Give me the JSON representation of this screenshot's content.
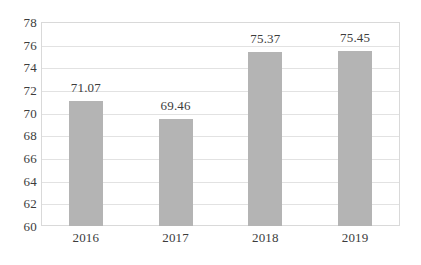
{
  "chart_data": {
    "type": "bar",
    "title": "",
    "subtitle": "",
    "xlabel": "",
    "ylabel": "",
    "categories": [
      "2016",
      "2017",
      "2018",
      "2019"
    ],
    "values": [
      71.07,
      69.46,
      75.37,
      75.45
    ],
    "data_labels": [
      "71.07",
      "69.46",
      "75.37",
      "75.45"
    ],
    "ylim": [
      60,
      78
    ],
    "ytick_step": 2,
    "yticks": [
      78,
      76,
      74,
      72,
      70,
      68,
      66,
      64,
      62,
      60
    ],
    "ytick_labels": [
      "78",
      "76",
      "74",
      "72",
      "70",
      "68",
      "66",
      "64",
      "62",
      "60"
    ],
    "grid": true,
    "grid_axis": "y",
    "legend": false,
    "legend_position": "none",
    "bar_color": "#b4b4b4",
    "gridline_color": "#e2e2e2",
    "plot_border_color": "#d9d9d9",
    "text_color": "#3c3c3c",
    "background_color": "#ffffff"
  }
}
